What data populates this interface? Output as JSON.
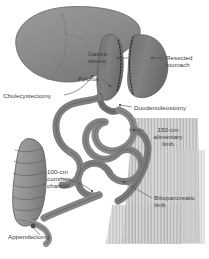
{
  "figure": {
    "background_color": "#ffffff",
    "palette": {
      "liver": "#8e8e8e",
      "liver_edge": "#6b6b6b",
      "stomach": "#7d7d7d",
      "stomach_edge": "#5f5f5f",
      "bowel": "#8a8a8a",
      "bowel_edge": "#606060",
      "colon": "#9a9a9a",
      "mesentery": "#b5b5b5",
      "staple_line": "#2b2b2b",
      "leader_line": "#555555",
      "label_text": "#3a3a3a"
    }
  },
  "labels": [
    {
      "id": "gastric-sleeve",
      "text": "Gastric\nsleeve"
    },
    {
      "id": "resected-stomach",
      "text": "Resected\nstomach"
    },
    {
      "id": "pylorus",
      "text": "Pylorus"
    },
    {
      "id": "cholecystectomy",
      "text": "Cholecystectomy"
    },
    {
      "id": "duodenoileostomy",
      "text": "Duodenoileostomy"
    },
    {
      "id": "alimentary-limb",
      "text": "150-cm\nalimentary\nlimb"
    },
    {
      "id": "biliopancreatic-limb",
      "text": "Biliopancreatic\nlimb"
    },
    {
      "id": "common-channel",
      "text": "100-cm\ncommon\nchannel"
    },
    {
      "id": "appendectomy",
      "text": "Appendectomy"
    }
  ],
  "measurements": {
    "alimentary_limb_length": "150-cm",
    "common_channel_length": "100-cm"
  },
  "structures": [
    "liver",
    "gastric sleeve",
    "resected stomach",
    "pylorus",
    "duodenum",
    "small bowel loops",
    "colon",
    "appendix",
    "mesentery"
  ]
}
